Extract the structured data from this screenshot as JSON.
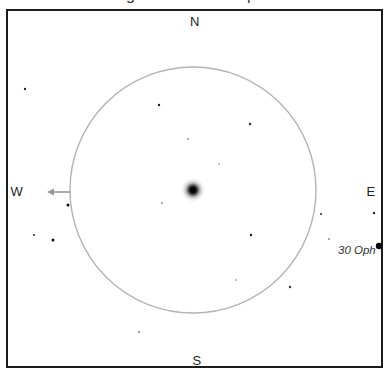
{
  "title_cropped": {
    "descenders": [
      "g",
      "p"
    ]
  },
  "compass": {
    "north": "N",
    "south": "S",
    "east": "E",
    "west": "W"
  },
  "labels": {
    "star_label": "30 Oph"
  },
  "colors": {
    "background": "#ffffff",
    "frame": "#1c1c1c",
    "circle": "#b4b4b4",
    "arrow": "#989898",
    "text": "#222222"
  },
  "chart": {
    "type": "star-finder-chart",
    "field_circle": {
      "cx": 193,
      "cy": 190,
      "r": 123
    },
    "cluster": {
      "cx": 193,
      "cy": 190,
      "halo_r": 12
    },
    "west_arrow": {
      "y": 192,
      "x_tail": 70,
      "x_tip": 47
    },
    "stars": [
      {
        "x": 25,
        "y": 89,
        "r": 1.2,
        "opacity": 0.85
      },
      {
        "x": 159,
        "y": 105,
        "r": 1.2,
        "opacity": 0.9
      },
      {
        "x": 250,
        "y": 124,
        "r": 1.2,
        "opacity": 0.85
      },
      {
        "x": 188,
        "y": 139,
        "r": 1.0,
        "opacity": 0.4
      },
      {
        "x": 219,
        "y": 164,
        "r": 0.9,
        "opacity": 0.35
      },
      {
        "x": 162,
        "y": 203,
        "r": 1.0,
        "opacity": 0.45
      },
      {
        "x": 68,
        "y": 205,
        "r": 1.5,
        "opacity": 0.95
      },
      {
        "x": 321,
        "y": 214,
        "r": 1.1,
        "opacity": 0.8
      },
      {
        "x": 374,
        "y": 213,
        "r": 1.2,
        "opacity": 0.85
      },
      {
        "x": 34,
        "y": 235,
        "r": 1.1,
        "opacity": 0.8
      },
      {
        "x": 53,
        "y": 240,
        "r": 1.5,
        "opacity": 0.95
      },
      {
        "x": 329,
        "y": 239,
        "r": 1.0,
        "opacity": 0.45
      },
      {
        "x": 251,
        "y": 235,
        "r": 1.2,
        "opacity": 0.9
      },
      {
        "x": 236,
        "y": 280,
        "r": 0.9,
        "opacity": 0.35
      },
      {
        "x": 290,
        "y": 287,
        "r": 1.2,
        "opacity": 0.8
      },
      {
        "x": 139,
        "y": 332,
        "r": 1.0,
        "opacity": 0.55
      },
      {
        "x": 379,
        "y": 246,
        "r": 3.2,
        "opacity": 1.0,
        "name": "30 Oph"
      }
    ]
  }
}
